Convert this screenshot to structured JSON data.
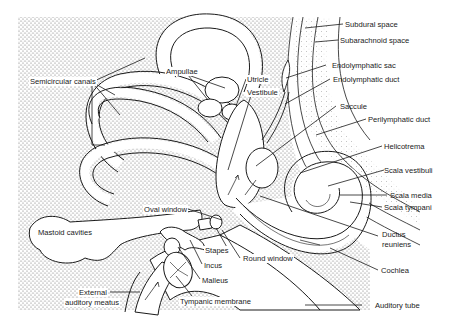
{
  "figure": {
    "colors": {
      "ink": "#1a1a1a",
      "stipple": "#9a9a9a",
      "paper": "#ffffff"
    }
  },
  "labels": {
    "subdural_space": "Subdural space",
    "subarachnoid_space": "Subarachnoid space",
    "semicircular_canals": "Semicircular canals",
    "ampullae": "Ampullae",
    "utricle": "Utricle",
    "vestibule": "Vestibule",
    "endolymphatic_sac": "Endolymphatic sac",
    "endolymphatic_duct": "Endolymphatic duct",
    "saccule": "Saccule",
    "perilymphatic_duct": "Perilymphatic duct",
    "helicotrema": "Helicotrema",
    "scala_vestibuli": "Scala vestibuli",
    "scala_media": "Scala media",
    "scala_tympani": "Scala tympani",
    "ductus_reuniens_line1": "Ductus",
    "ductus_reuniens_line2": "reuniens",
    "cochlea": "Cochlea",
    "oval_window": "Oval window",
    "mastoid_cavities": "Mastoid cavities",
    "stapes": "Stapes",
    "round_window": "Round window",
    "incus": "Incus",
    "malleus": "Malleus",
    "external_auditory_meatus_line1": "External",
    "external_auditory_meatus_line2": "auditory meatus",
    "tympanic_membrane": "Tympanic membrane",
    "auditory_tube": "Auditory tube"
  }
}
